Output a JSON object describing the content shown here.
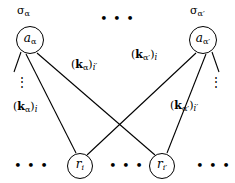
{
  "figure": {
    "background_color": "#ffffff",
    "stroke_color": "#000000",
    "nodes": {
      "top_left": {
        "label_main": "a",
        "label_sub": "α",
        "cx": 30,
        "cy": 40,
        "r": 14
      },
      "top_right": {
        "label_main": "a",
        "label_sub": "α′",
        "cx": 203,
        "cy": 40,
        "r": 14
      },
      "bottom_left": {
        "label_main": "r",
        "label_sub": "i",
        "cx": 80,
        "cy": 166,
        "r": 13
      },
      "bottom_right": {
        "label_main": "r",
        "label_sub": "i′",
        "cx": 162,
        "cy": 166,
        "r": 13
      }
    },
    "sigma_labels": [
      {
        "name": "sigma-alpha",
        "text_main": "σ",
        "text_sub": "α",
        "x": 17,
        "y": 4
      },
      {
        "name": "sigma-alpha-prime",
        "text_main": "σ",
        "text_sub": "α′",
        "x": 190,
        "y": 4
      }
    ],
    "edge_labels": [
      {
        "name": "k-alpha-i-prime",
        "open": "(",
        "k": "k",
        "sub_alpha": "α",
        "close": ")",
        "sub_index": "i′",
        "x": 71,
        "y": 58
      },
      {
        "name": "k-alpha-i",
        "open": "(",
        "k": "k",
        "sub_alpha": "α",
        "close": ")",
        "sub_index": "i",
        "x": 13,
        "y": 100
      },
      {
        "name": "k-alpha-prime-i",
        "open": "(",
        "k": "k",
        "sub_alpha": "α′",
        "close": ")",
        "sub_index": "i",
        "x": 131,
        "y": 48
      },
      {
        "name": "k-alpha-prime-i-prime",
        "open": "(",
        "k": "k",
        "sub_alpha": "α′",
        "close": ")",
        "sub_index": "i′",
        "x": 170,
        "y": 99
      }
    ],
    "ellipses": [
      {
        "name": "top-center-ellipsis",
        "text": "• • •",
        "x": 100,
        "y": 12
      },
      {
        "name": "bottom-left-ellipsis",
        "text": "• • •",
        "x": 14,
        "y": 159
      },
      {
        "name": "bottom-center-ellipsis",
        "text": "• • •",
        "x": 109,
        "y": 159
      },
      {
        "name": "bottom-right-ellipsis",
        "text": "• • •",
        "x": 196,
        "y": 159
      }
    ],
    "vertical_dots": [
      {
        "name": "left-vertical-dots",
        "text": "⋮",
        "x": 16,
        "y": 76
      },
      {
        "name": "right-vertical-dots",
        "text": "⋮",
        "x": 210,
        "y": 76
      }
    ],
    "edges": [
      {
        "name": "edge-a-alpha-to-r-i",
        "x1": 26,
        "y1": 54,
        "x2": 76,
        "y2": 153
      },
      {
        "name": "edge-a-alpha-to-r-i-prime",
        "x1": 37,
        "y1": 53,
        "x2": 155,
        "y2": 155
      },
      {
        "name": "edge-a-alpha-to-extra",
        "x1": 21,
        "y1": 52,
        "x2": 14,
        "y2": 72
      },
      {
        "name": "edge-a-alpha-prime-to-r-i",
        "x1": 196,
        "y1": 53,
        "x2": 87,
        "y2": 155
      },
      {
        "name": "edge-a-alpha-prime-to-r-i-prime",
        "x1": 206,
        "y1": 54,
        "x2": 167,
        "y2": 153
      },
      {
        "name": "edge-a-alpha-prime-to-extra",
        "x1": 212,
        "y1": 52,
        "x2": 219,
        "y2": 72
      }
    ]
  }
}
